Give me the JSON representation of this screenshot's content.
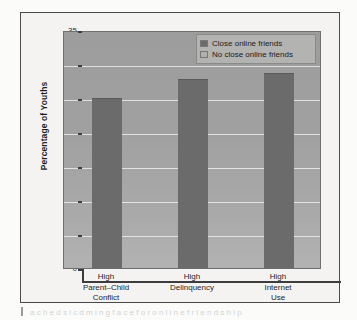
{
  "figure": {
    "background_color": "#f4f3f1",
    "border_color": "#4a4a4a",
    "plot_background_color": "#9d9d9d",
    "bar_color": "#6b6b6b",
    "gridline_color": "#e6e5e2"
  },
  "chart_data": {
    "type": "bar",
    "title": "",
    "xlabel": "",
    "ylabel": "Percentage of Youths",
    "categories": [
      "High\nParent–Child\nConflict",
      "High\nDelinquency",
      "High\nInternet\nUse"
    ],
    "series": [
      {
        "name": "Close online friends",
        "values": [
          25.0,
          27.8,
          28.7
        ]
      },
      {
        "name": "No close online friends",
        "values": [
          null,
          null,
          null
        ]
      }
    ],
    "ylim": [
      0,
      35
    ],
    "yticks": [
      0,
      5,
      10,
      15,
      20,
      25,
      30,
      35
    ],
    "ytick_labels": [
      "0",
      "5",
      "10",
      "15",
      "20",
      "25",
      "30",
      "35"
    ],
    "grid": true,
    "legend_position": "top-right"
  },
  "legend": {
    "entries": [
      {
        "label": "Close online friends",
        "color": "#6b6b6b"
      },
      {
        "label": "No close online friends",
        "color": "#b0b0ae"
      }
    ]
  },
  "caption": {
    "fragment": "a c h e d s i c d m i n g f a c e f o r o n l i n e f r i e n d s h i p"
  }
}
